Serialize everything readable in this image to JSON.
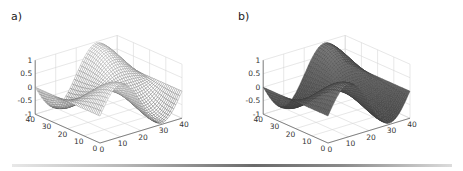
{
  "chart_data": [
    {
      "panel_label": "a)",
      "type": "surface",
      "render_style": "mesh",
      "title": "",
      "function": "z = sin(x*pi/20) * cos(y*pi/20) (approx)",
      "x": {
        "ticks": [
          0,
          10,
          20,
          30,
          40
        ],
        "range": [
          0,
          40
        ]
      },
      "y": {
        "ticks": [
          0,
          10,
          20,
          30,
          40
        ],
        "range": [
          0,
          40
        ]
      },
      "z": {
        "ticks": [
          -1,
          -0.5,
          0,
          0.5,
          1
        ],
        "tick_labels": [
          "-1",
          "-0.5",
          "0",
          "0.5",
          "1"
        ],
        "range": [
          -1,
          1
        ]
      },
      "grid": true,
      "colors": {
        "edge": "#555555",
        "face": "#ffffff"
      }
    },
    {
      "panel_label": "b)",
      "type": "surface",
      "render_style": "shaded",
      "title": "",
      "function": "z = sin(x*pi/20) * cos(y*pi/20) (approx)",
      "x": {
        "ticks": [
          0,
          10,
          20,
          30,
          40
        ],
        "range": [
          0,
          40
        ]
      },
      "y": {
        "ticks": [
          0,
          10,
          20,
          30,
          40
        ],
        "range": [
          0,
          40
        ]
      },
      "z": {
        "ticks": [
          -1,
          -0.5,
          0,
          0.5,
          1
        ],
        "tick_labels": [
          "-1",
          "-0.5",
          "0",
          "0.5",
          "1"
        ],
        "range": [
          -1,
          1
        ]
      },
      "grid": true,
      "colors": {
        "edge": "#3a3a3a",
        "face": "#6e6e6e"
      }
    }
  ],
  "panels": {
    "a": {
      "label": "a)"
    },
    "b": {
      "label": "b)"
    }
  }
}
